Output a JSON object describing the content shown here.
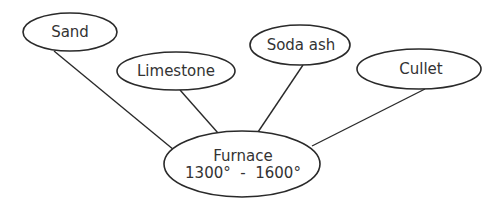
{
  "diagram": {
    "type": "hub-and-spoke",
    "nodes": [
      {
        "id": "sand",
        "label": "Sand"
      },
      {
        "id": "limestone",
        "label": "Limestone"
      },
      {
        "id": "soda_ash",
        "label": "Soda ash"
      },
      {
        "id": "cullet",
        "label": "Cullet"
      },
      {
        "id": "furnace",
        "label": "Furnace",
        "sublabel": "1300° - 1600°"
      }
    ],
    "edges": [
      {
        "from": "sand",
        "to": "furnace"
      },
      {
        "from": "limestone",
        "to": "furnace"
      },
      {
        "from": "soda_ash",
        "to": "furnace"
      },
      {
        "from": "cullet",
        "to": "furnace"
      }
    ]
  },
  "labels": {
    "sand": "Sand",
    "limestone": "Limestone",
    "soda_ash": "Soda ash",
    "cullet": "Cullet",
    "furnace": "Furnace",
    "furnace_temp": "1300°  -  1600°"
  }
}
